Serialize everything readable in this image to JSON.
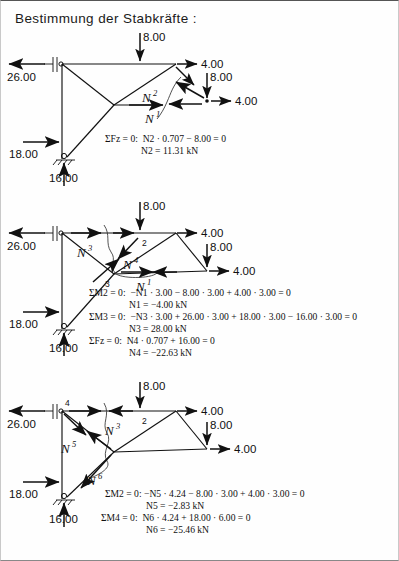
{
  "page": {
    "title": "Bestimmung der Stabkräfte :",
    "language": "de"
  },
  "common_labels": {
    "load_vertical_top": "8.00",
    "load_horizontal_top": "4.00",
    "load_vertical_right": "8.00",
    "load_horizontal_right": "4.00",
    "reaction_left_horizontal": "26.00",
    "reaction_support_horizontal": "18.00",
    "reaction_support_vertical": "16.00",
    "unit": "kN"
  },
  "figures": [
    {
      "id": "figure-1",
      "name": "ritter-cut-1",
      "loads": {
        "top_vertical": "8.00",
        "top_horizontal": "4.00",
        "right_vertical": "8.00",
        "right_horizontal": "4.00"
      },
      "reactions": {
        "left_horizontal": "26.00",
        "support_horizontal": "18.00",
        "support_vertical": "16.00"
      },
      "members": [
        {
          "name": "N2",
          "base": "N",
          "sup": "2"
        },
        {
          "name": "N1",
          "base": "N",
          "sup": "1"
        }
      ],
      "node_numbers": [],
      "equations": [
        {
          "sum_symbol": "ΣF",
          "sum_sub": "z",
          "body": " = 0:  N² · 0.707 − 8.00 = 0",
          "text": "ΣFz = 0:  N2 · 0.707 − 8.00 = 0"
        },
        {
          "sum_symbol": "",
          "sum_sub": "",
          "body": "N² = 11.31 kN",
          "text": "N2 = 11.31 kN",
          "is_result": true
        }
      ]
    },
    {
      "id": "figure-2",
      "name": "ritter-cut-2",
      "loads": {
        "top_vertical": "8.00",
        "top_horizontal": "4.00",
        "right_vertical": "8.00",
        "right_horizontal": "4.00"
      },
      "reactions": {
        "left_horizontal": "26.00",
        "support_horizontal": "18.00",
        "support_vertical": "16.00"
      },
      "members": [
        {
          "name": "N3",
          "base": "N",
          "sup": "3"
        },
        {
          "name": "N4",
          "base": "N",
          "sup": "4"
        },
        {
          "name": "N1",
          "base": "N",
          "sup": "1"
        }
      ],
      "node_numbers": [
        "2",
        "3"
      ],
      "equations": [
        {
          "text": "ΣM2 = 0:  −N1 · 3.00 − 8.00 · 3.00 + 4.00 · 3.00 = 0"
        },
        {
          "text": "N1 = −4.00 kN",
          "is_result": true
        },
        {
          "text": "ΣM3 = 0:  −N3 · 3.00 + 26.00 · 3.00 + 18.00 · 3.00 − 16.00 · 3.00 = 0"
        },
        {
          "text": "N3 = 28.00 kN",
          "is_result": true
        },
        {
          "text": "ΣFz = 0:  N4 · 0.707 + 16.00 = 0"
        },
        {
          "text": "N4 = −22.63 kN",
          "is_result": true
        }
      ]
    },
    {
      "id": "figure-3",
      "name": "ritter-cut-3",
      "loads": {
        "top_vertical": "8.00",
        "top_horizontal": "4.00",
        "right_vertical": "8.00",
        "right_horizontal": "4.00"
      },
      "reactions": {
        "left_horizontal": "26.00",
        "support_horizontal": "18.00",
        "support_vertical": "16.00"
      },
      "members": [
        {
          "name": "N3",
          "base": "N",
          "sup": "3"
        },
        {
          "name": "N5",
          "base": "N",
          "sup": "5"
        },
        {
          "name": "N6",
          "base": "N",
          "sup": "6"
        }
      ],
      "node_numbers": [
        "4",
        "2"
      ],
      "equations": [
        {
          "text": "ΣM2 = 0: −N5 · 4.24 − 8.00 · 3.00 + 4.00 · 3.00 = 0"
        },
        {
          "text": "N5 = −2.83 kN",
          "is_result": true
        },
        {
          "text": "ΣM4 = 0:  N6 · 4.24 + 18.00 · 6.00 = 0"
        },
        {
          "text": "N6 = −25.46 kN",
          "is_result": true
        }
      ]
    }
  ],
  "equation_tokens": {
    "sum_F_z": "ΣFz",
    "sum_M_2": "ΣM2",
    "sum_M_3": "ΣM3",
    "sum_M_4": "ΣM4",
    "equals_zero": "= 0",
    "kN": "kN"
  },
  "colors": {
    "ink": "#111111",
    "paper": "#fefefe",
    "frame": "#555555"
  }
}
